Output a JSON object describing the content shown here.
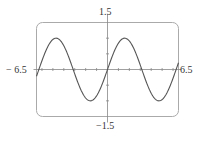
{
  "chart_data": {
    "type": "line",
    "title": "",
    "function": "y = sin(x)",
    "xlabel": "",
    "ylabel": "",
    "xlim": [
      -6.5,
      6.5
    ],
    "ylim": [
      -1.5,
      1.5
    ],
    "x_tick_step": 1,
    "y_tick_step": 0.5,
    "grid": false,
    "axis_labels": {
      "x_min": "− 6.5",
      "x_max": "6.5",
      "y_max": "1.5",
      "y_min": "−1.5"
    },
    "series": [
      {
        "name": "sin(x)",
        "x": [
          -6.5,
          -6.0,
          -5.5,
          -5.0,
          -4.5,
          -4.0,
          -3.5,
          -3.0,
          -2.5,
          -2.0,
          -1.5,
          -1.0,
          -0.5,
          0,
          0.5,
          1.0,
          1.5,
          2.0,
          2.5,
          3.0,
          3.5,
          4.0,
          4.5,
          5.0,
          5.5,
          6.0,
          6.5
        ],
        "values": [
          -0.215,
          0.279,
          0.706,
          0.959,
          0.978,
          0.757,
          0.351,
          -0.141,
          -0.598,
          -0.909,
          -0.997,
          -0.841,
          -0.479,
          0,
          0.479,
          0.841,
          0.997,
          0.909,
          0.598,
          0.141,
          -0.351,
          -0.757,
          -0.978,
          -0.959,
          -0.706,
          -0.279,
          0.215
        ]
      }
    ]
  },
  "colors": {
    "curve": "#555555",
    "frame": "#aaaaaa",
    "axes": "#888888"
  }
}
